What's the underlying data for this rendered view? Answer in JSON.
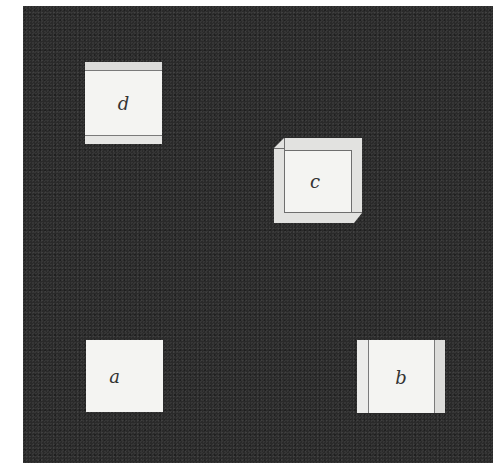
{
  "figure": {
    "background_color": "#2a2a2a",
    "square_color": "#f4f4f2",
    "squares": [
      {
        "id": "d",
        "label": "d"
      },
      {
        "id": "c",
        "label": "c"
      },
      {
        "id": "a",
        "label": "a"
      },
      {
        "id": "b",
        "label": "b"
      }
    ]
  }
}
